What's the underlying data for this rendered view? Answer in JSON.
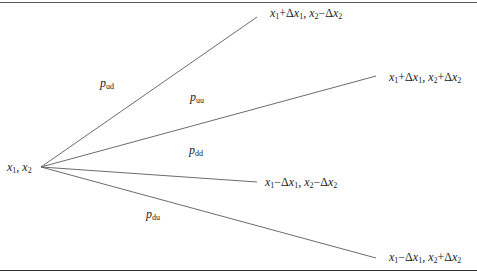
{
  "diagram": {
    "type": "trinomial-tree-branching",
    "root": {
      "label_parts": [
        "x",
        "1",
        ", ",
        "x",
        "2"
      ],
      "text": "x1, x2",
      "position": [
        41,
        167
      ]
    },
    "branches": [
      {
        "id": "ud",
        "probability": {
          "base": "p",
          "sub": "ud",
          "text": "p_ud",
          "position": [
            100,
            83
          ]
        },
        "end": [
          257,
          17
        ],
        "node": {
          "text": "x1+Δx1, x2−Δx2",
          "parts": {
            "x1": "x",
            "s1": "1",
            "op1": "+Δ",
            "x1b": "x",
            "s1b": "1",
            "sep": ", ",
            "x2": "x",
            "s2": "2",
            "op2": "−Δ",
            "x2b": "x",
            "s2b": "2"
          },
          "position": [
            270,
            8
          ]
        }
      },
      {
        "id": "uu",
        "probability": {
          "base": "p",
          "sub": "uu",
          "text": "p_uu",
          "position": [
            190,
            97
          ]
        },
        "end": [
          376,
          76
        ],
        "node": {
          "text": "x1+Δx1, x2+Δx2",
          "parts": {
            "x1": "x",
            "s1": "1",
            "op1": "+Δ",
            "x1b": "x",
            "s1b": "1",
            "sep": ", ",
            "x2": "x",
            "s2": "2",
            "op2": "+Δ",
            "x2b": "x",
            "s2b": "2"
          },
          "position": [
            389,
            70
          ]
        }
      },
      {
        "id": "dd",
        "probability": {
          "base": "p",
          "sub": "dd",
          "text": "p_dd",
          "position": [
            189,
            150
          ]
        },
        "end": [
          257,
          182
        ],
        "node": {
          "text": "x1−Δx1, x2−Δx2",
          "parts": {
            "x1": "x",
            "s1": "1",
            "op1": "−Δ",
            "x1b": "x",
            "s1b": "1",
            "sep": ", ",
            "x2": "x",
            "s2": "2",
            "op2": "−Δ",
            "x2b": "x",
            "s2b": "2"
          },
          "position": [
            265,
            175
          ]
        }
      },
      {
        "id": "du",
        "probability": {
          "base": "p",
          "sub": "du",
          "text": "p_du",
          "position": [
            146,
            214
          ]
        },
        "end": [
          376,
          258
        ],
        "node": {
          "text": "x1−Δx1, x2+Δx2",
          "parts": {
            "x1": "x",
            "s1": "1",
            "op1": "−Δ",
            "x1b": "x",
            "s1b": "1",
            "sep": ", ",
            "x2": "x",
            "s2": "2",
            "op2": "+Δ",
            "x2b": "x",
            "s2b": "2"
          },
          "position": [
            389,
            250
          ]
        }
      }
    ],
    "colors": {
      "line": "#555555",
      "text": "#1a1a1a",
      "rule": "#444444",
      "background": "#ffffff"
    }
  }
}
